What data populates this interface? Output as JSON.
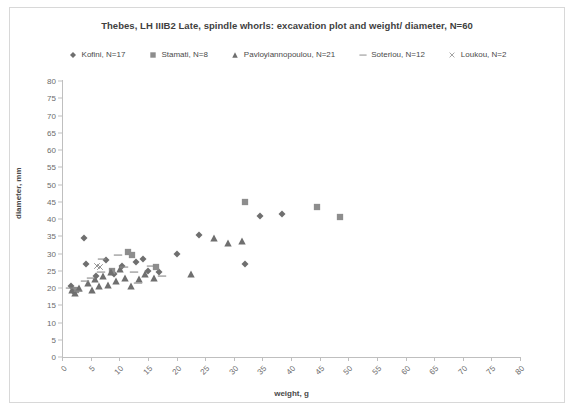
{
  "chart_data": {
    "type": "scatter",
    "title": "Thebes, LH IIIB2 Late, spindle whorls: excavation plot and weight/ diameter, N=60",
    "xlabel": "weight, g",
    "ylabel": "diameter, mm",
    "xlim": [
      0,
      80
    ],
    "ylim": [
      0,
      80
    ],
    "xticks": [
      0,
      5,
      10,
      15,
      20,
      25,
      30,
      35,
      40,
      45,
      50,
      55,
      60,
      65,
      70,
      75,
      80
    ],
    "yticks": [
      0,
      5,
      10,
      15,
      20,
      25,
      30,
      35,
      40,
      45,
      50,
      55,
      60,
      65,
      70,
      75,
      80
    ],
    "grid": false,
    "legend_position": "top",
    "marker_color": "#6f6f6f",
    "series": [
      {
        "name": "Kofini, N=17",
        "label": "Kofini, N=17",
        "marker": "diamond",
        "count": 17,
        "points": [
          [
            1.5,
            20.5
          ],
          [
            2.0,
            19.0
          ],
          [
            3.8,
            34.5
          ],
          [
            4.2,
            27.0
          ],
          [
            6.0,
            23.5
          ],
          [
            7.6,
            28.0
          ],
          [
            9.0,
            24.0
          ],
          [
            10.5,
            26.5
          ],
          [
            13.0,
            27.5
          ],
          [
            14.2,
            28.5
          ],
          [
            15.0,
            25.0
          ],
          [
            17.0,
            24.5
          ],
          [
            20.0,
            30.0
          ],
          [
            24.0,
            35.5
          ],
          [
            32.0,
            27.0
          ],
          [
            34.5,
            41.0
          ],
          [
            38.5,
            41.5
          ]
        ]
      },
      {
        "name": "Stamati, N=8",
        "label": "Stamati, N=8",
        "marker": "square",
        "count": 8,
        "points": [
          [
            2.5,
            19.5
          ],
          [
            8.8,
            25.0
          ],
          [
            11.5,
            30.5
          ],
          [
            12.3,
            29.5
          ],
          [
            16.5,
            26.0
          ],
          [
            32.0,
            45.0
          ],
          [
            44.5,
            43.5
          ],
          [
            48.5,
            40.5
          ]
        ]
      },
      {
        "name": "Pavloyiannopoulou, N=21",
        "label": "Pavloyiannopoulou, N=21",
        "marker": "triangle",
        "count": 21,
        "points": [
          [
            1.8,
            19.5
          ],
          [
            2.2,
            18.5
          ],
          [
            3.0,
            20.0
          ],
          [
            4.5,
            21.5
          ],
          [
            5.2,
            19.5
          ],
          [
            5.8,
            22.5
          ],
          [
            6.5,
            20.5
          ],
          [
            7.2,
            23.5
          ],
          [
            8.0,
            21.0
          ],
          [
            8.6,
            24.5
          ],
          [
            9.4,
            22.0
          ],
          [
            10.2,
            25.5
          ],
          [
            11.0,
            23.0
          ],
          [
            12.0,
            20.5
          ],
          [
            13.5,
            22.5
          ],
          [
            14.5,
            24.0
          ],
          [
            16.0,
            23.0
          ],
          [
            22.5,
            24.0
          ],
          [
            26.5,
            34.5
          ],
          [
            29.0,
            33.0
          ],
          [
            31.5,
            33.5
          ]
        ]
      },
      {
        "name": "Soteriou, N=12",
        "label": "Soteriou, N=12",
        "marker": "dash",
        "count": 12,
        "points": [
          [
            1.4,
            20.0
          ],
          [
            2.8,
            19.0
          ],
          [
            4.0,
            22.0
          ],
          [
            5.0,
            23.0
          ],
          [
            6.8,
            24.5
          ],
          [
            7.0,
            28.5
          ],
          [
            9.8,
            29.5
          ],
          [
            10.8,
            26.0
          ],
          [
            12.5,
            24.5
          ],
          [
            13.2,
            21.5
          ],
          [
            15.5,
            26.5
          ],
          [
            17.5,
            23.5
          ]
        ]
      },
      {
        "name": "Loukou, N=2",
        "label": "Loukou, N=2",
        "marker": "cross",
        "count": 2,
        "points": [
          [
            6.2,
            26.5
          ],
          [
            6.6,
            26.0
          ]
        ]
      }
    ]
  },
  "legend_marks": {
    "diamond": "diamond-marker-icon",
    "square": "square-marker-icon",
    "triangle": "triangle-marker-icon",
    "dash": "dash-marker-icon",
    "cross": "cross-marker-icon"
  }
}
